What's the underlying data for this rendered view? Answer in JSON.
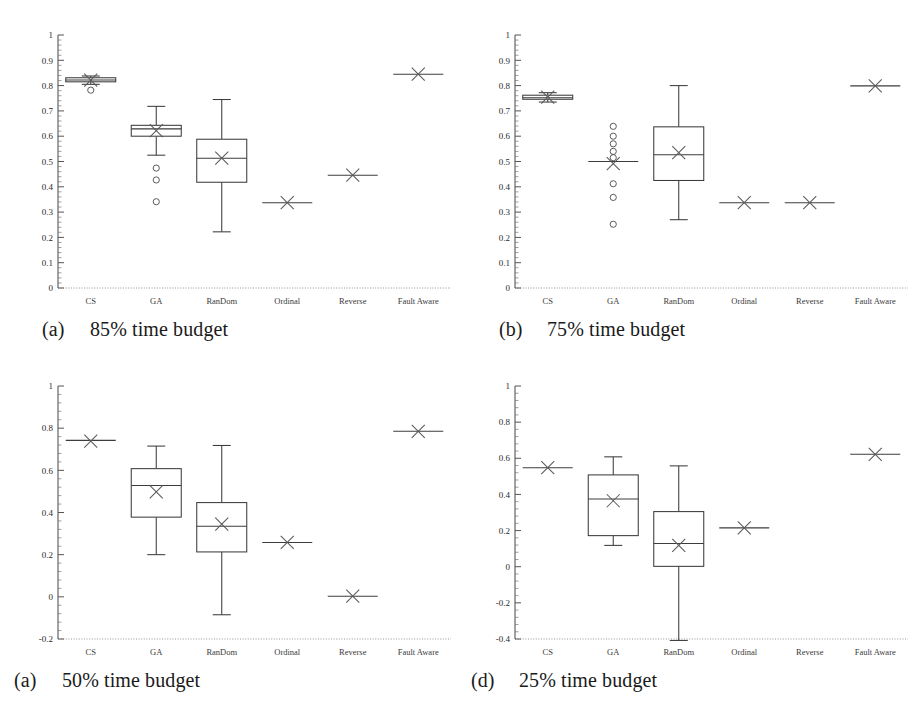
{
  "figure": {
    "kind": "box-plot-grid",
    "rows": 2,
    "cols": 2,
    "categories": [
      "CS",
      "GA",
      "RanDom",
      "Ordinal",
      "Reverse",
      "Fault Aware"
    ]
  },
  "chart_data": [
    {
      "type": "box",
      "panel_id": "a",
      "caption_letter": "(a)",
      "caption_text": "85% time budget",
      "title": "",
      "xlabel": "",
      "ylabel": "",
      "ylim": [
        0,
        1
      ],
      "yticks": [
        0,
        0.1,
        0.2,
        0.3,
        0.4,
        0.5,
        0.6,
        0.7,
        0.8,
        0.9,
        1
      ],
      "ytick_labels": [
        "0",
        "0.1",
        "0.2",
        "0.3",
        "0.4",
        "0.5",
        "0.6",
        "0.7",
        "0.8",
        "0.9",
        "1"
      ],
      "minor_ticks_per_interval": 5,
      "grid": false,
      "legend": "none",
      "categories": [
        "CS",
        "GA",
        "RanDom",
        "Ordinal",
        "Reverse",
        "Fault Aware"
      ],
      "boxes": [
        {
          "label": "CS",
          "min": 0.805,
          "q1": 0.815,
          "median": 0.822,
          "q3": 0.831,
          "max": 0.838,
          "mean": 0.822,
          "outliers": [
            0.782
          ]
        },
        {
          "label": "GA",
          "min": 0.525,
          "q1": 0.6,
          "median": 0.629,
          "q3": 0.643,
          "max": 0.718,
          "mean": 0.622,
          "outliers": [
            0.474,
            0.427,
            0.341
          ]
        },
        {
          "label": "RanDom",
          "min": 0.222,
          "q1": 0.418,
          "median": 0.513,
          "q3": 0.588,
          "max": 0.745,
          "mean": 0.513,
          "outliers": []
        },
        {
          "label": "Ordinal",
          "min": 0.337,
          "q1": 0.337,
          "median": 0.337,
          "q3": 0.337,
          "max": 0.337,
          "mean": 0.337,
          "outliers": []
        },
        {
          "label": "Reverse",
          "min": 0.446,
          "q1": 0.446,
          "median": 0.446,
          "q3": 0.446,
          "max": 0.446,
          "mean": 0.446,
          "outliers": []
        },
        {
          "label": "Fault Aware",
          "min": 0.845,
          "q1": 0.845,
          "median": 0.845,
          "q3": 0.845,
          "max": 0.845,
          "mean": 0.845,
          "outliers": []
        }
      ]
    },
    {
      "type": "box",
      "panel_id": "b",
      "caption_letter": "(b)",
      "caption_text": "75% time budget",
      "title": "",
      "xlabel": "",
      "ylabel": "",
      "ylim": [
        0,
        1
      ],
      "yticks": [
        0,
        0.1,
        0.2,
        0.3,
        0.4,
        0.5,
        0.6,
        0.7,
        0.8,
        0.9,
        1
      ],
      "ytick_labels": [
        "0",
        "0.1",
        "0.2",
        "0.3",
        "0.4",
        "0.5",
        "0.6",
        "0.7",
        "0.8",
        "0.9",
        "1"
      ],
      "minor_ticks_per_interval": 5,
      "grid": false,
      "legend": "none",
      "categories": [
        "CS",
        "GA",
        "RanDom",
        "Ordinal",
        "Reverse",
        "Fault Aware"
      ],
      "boxes": [
        {
          "label": "CS",
          "min": 0.735,
          "q1": 0.746,
          "median": 0.752,
          "q3": 0.762,
          "max": 0.772,
          "mean": 0.754,
          "outliers": []
        },
        {
          "label": "GA",
          "min": 0.5,
          "q1": 0.5,
          "median": 0.5,
          "q3": 0.5,
          "max": 0.5,
          "mean": 0.492,
          "outliers": [
            0.639,
            0.6,
            0.57,
            0.54,
            0.515,
            0.412,
            0.358,
            0.252
          ]
        },
        {
          "label": "RanDom",
          "min": 0.27,
          "q1": 0.425,
          "median": 0.527,
          "q3": 0.637,
          "max": 0.8,
          "mean": 0.535,
          "outliers": []
        },
        {
          "label": "Ordinal",
          "min": 0.337,
          "q1": 0.337,
          "median": 0.337,
          "q3": 0.337,
          "max": 0.337,
          "mean": 0.337,
          "outliers": []
        },
        {
          "label": "Reverse",
          "min": 0.337,
          "q1": 0.337,
          "median": 0.337,
          "q3": 0.337,
          "max": 0.337,
          "mean": 0.337,
          "outliers": []
        },
        {
          "label": "Fault Aware",
          "min": 0.799,
          "q1": 0.799,
          "median": 0.799,
          "q3": 0.799,
          "max": 0.799,
          "mean": 0.799,
          "outliers": []
        }
      ]
    },
    {
      "type": "box",
      "panel_id": "c",
      "caption_letter": "(a)",
      "caption_text": "50% time budget",
      "title": "",
      "xlabel": "",
      "ylabel": "",
      "ylim": [
        -0.2,
        1
      ],
      "yticks": [
        -0.2,
        0,
        0.2,
        0.4,
        0.6,
        0.8,
        1
      ],
      "ytick_labels": [
        "-0.2",
        "0",
        "0.2",
        "0.4",
        "0.6",
        "0.8",
        "1"
      ],
      "minor_ticks_per_interval": 5,
      "grid": false,
      "legend": "none",
      "categories": [
        "CS",
        "GA",
        "RanDom",
        "Ordinal",
        "Reverse",
        "Fault Aware"
      ],
      "boxes": [
        {
          "label": "CS",
          "min": 0.742,
          "q1": 0.742,
          "median": 0.742,
          "q3": 0.742,
          "max": 0.742,
          "mean": 0.739,
          "outliers": []
        },
        {
          "label": "GA",
          "min": 0.2,
          "q1": 0.378,
          "median": 0.528,
          "q3": 0.608,
          "max": 0.715,
          "mean": 0.498,
          "outliers": []
        },
        {
          "label": "RanDom",
          "min": -0.085,
          "q1": 0.213,
          "median": 0.335,
          "q3": 0.447,
          "max": 0.718,
          "mean": 0.345,
          "outliers": []
        },
        {
          "label": "Ordinal",
          "min": 0.258,
          "q1": 0.258,
          "median": 0.258,
          "q3": 0.258,
          "max": 0.258,
          "mean": 0.258,
          "outliers": []
        },
        {
          "label": "Reverse",
          "min": 0.003,
          "q1": 0.003,
          "median": 0.003,
          "q3": 0.003,
          "max": 0.003,
          "mean": 0.003,
          "outliers": []
        },
        {
          "label": "Fault Aware",
          "min": 0.785,
          "q1": 0.785,
          "median": 0.785,
          "q3": 0.785,
          "max": 0.785,
          "mean": 0.785,
          "outliers": []
        }
      ]
    },
    {
      "type": "box",
      "panel_id": "d",
      "caption_letter": "(d)",
      "caption_text": "25% time budget",
      "title": "",
      "xlabel": "",
      "ylabel": "",
      "ylim": [
        -0.4,
        1
      ],
      "yticks": [
        -0.4,
        -0.2,
        0,
        0.2,
        0.4,
        0.6,
        0.8,
        1
      ],
      "ytick_labels": [
        "-0.4",
        "-0.2",
        "0",
        "0.2",
        "0.4",
        "0.6",
        "0.8",
        "1"
      ],
      "minor_ticks_per_interval": 5,
      "grid": false,
      "legend": "none",
      "categories": [
        "CS",
        "GA",
        "RanDom",
        "Ordinal",
        "Reverse",
        "Fault Aware"
      ],
      "boxes": [
        {
          "label": "CS",
          "min": 0.548,
          "q1": 0.548,
          "median": 0.548,
          "q3": 0.548,
          "max": 0.548,
          "mean": 0.548,
          "outliers": []
        },
        {
          "label": "GA",
          "min": 0.118,
          "q1": 0.172,
          "median": 0.375,
          "q3": 0.508,
          "max": 0.608,
          "mean": 0.365,
          "outliers": []
        },
        {
          "label": "RanDom",
          "min": -0.408,
          "q1": 0.002,
          "median": 0.128,
          "q3": 0.305,
          "max": 0.558,
          "mean": 0.118,
          "outliers": []
        },
        {
          "label": "Ordinal",
          "min": 0.215,
          "q1": 0.215,
          "median": 0.215,
          "q3": 0.215,
          "max": 0.215,
          "mean": 0.215,
          "outliers": []
        },
        {
          "label": "Reverse",
          "min": null,
          "q1": null,
          "median": null,
          "q3": null,
          "max": null,
          "mean": null,
          "outliers": []
        },
        {
          "label": "Fault Aware",
          "min": 0.622,
          "q1": 0.622,
          "median": 0.622,
          "q3": 0.622,
          "max": 0.622,
          "mean": 0.622,
          "outliers": []
        }
      ]
    }
  ]
}
